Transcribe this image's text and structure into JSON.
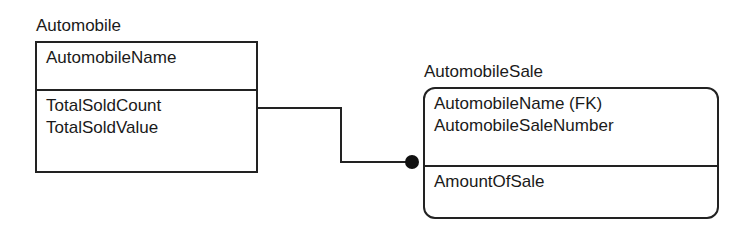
{
  "diagram": {
    "type": "IDEF1X entity-relationship diagram",
    "entities": [
      {
        "name": "Automobile",
        "kind": "independent",
        "key_attributes": [
          "AutomobileName"
        ],
        "non_key_attributes": [
          "TotalSoldCount",
          "TotalSoldValue"
        ]
      },
      {
        "name": "AutomobileSale",
        "kind": "dependent",
        "key_attributes": [
          "AutomobileName (FK)",
          "AutomobileSaleNumber"
        ],
        "non_key_attributes": [
          "AmountOfSale"
        ]
      }
    ],
    "relationships": [
      {
        "from": "Automobile",
        "to": "AutomobileSale",
        "type": "identifying",
        "cardinality": "one-to-many",
        "end_marker": "filled-dot"
      }
    ],
    "colors": {
      "line": "#222222",
      "text": "#1a1a1a",
      "background": "#ffffff"
    }
  }
}
